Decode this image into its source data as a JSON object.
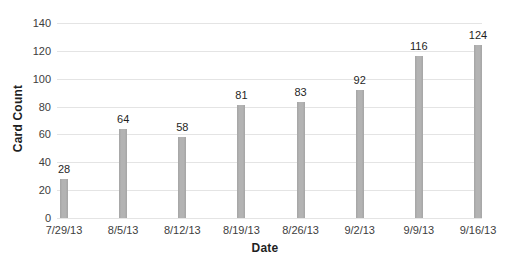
{
  "chart_data": {
    "type": "bar",
    "title": "",
    "xlabel": "Date",
    "ylabel": "Card Count",
    "categories": [
      "7/29/13",
      "8/5/13",
      "8/12/13",
      "8/19/13",
      "8/26/13",
      "9/2/13",
      "9/9/13",
      "9/16/13"
    ],
    "values": [
      28,
      64,
      58,
      81,
      83,
      92,
      116,
      124
    ],
    "data_labels_shown": true,
    "ylim": [
      0,
      140
    ],
    "yticks": [
      0,
      20,
      40,
      60,
      80,
      100,
      120,
      140
    ],
    "grid": "horizontal",
    "legend": "none",
    "bar_color": "#b3b3b3",
    "bar_edge_color": "#a5a5a5",
    "gridline_color": "#e4e4e4",
    "tick_text_color": "#3d3d3d",
    "data_label_color": "#1f1f1f",
    "axis_title_color": "#1f1f1f",
    "background": "#ffffff"
  }
}
